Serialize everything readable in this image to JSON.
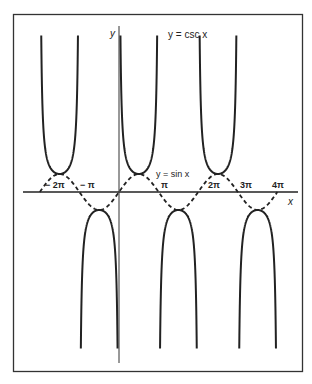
{
  "chart_data": {
    "type": "line",
    "title": "",
    "xlabel": "x",
    "ylabel": "y",
    "grid": false,
    "legend": "none",
    "xlim": [
      -2.05,
      4.45
    ],
    "xlim_units": "pi",
    "ylim": [
      -9,
      9
    ],
    "x_ticks": [
      {
        "value": -2,
        "label": "− 2π"
      },
      {
        "value": -1,
        "label": "− π"
      },
      {
        "value": 1,
        "label": "π"
      },
      {
        "value": 2,
        "label": "2π"
      },
      {
        "value": 3,
        "label": "3π"
      },
      {
        "value": 4,
        "label": "4π"
      }
    ],
    "series": [
      {
        "name": "y = csc x",
        "function": "csc",
        "style": "solid",
        "color": "#222222",
        "x_range_pi": [
          -2,
          4
        ]
      },
      {
        "name": "y = sin x",
        "function": "sin",
        "style": "dashed",
        "color": "#222222",
        "x_range_pi": [
          -2,
          4
        ]
      }
    ],
    "annotations": [
      {
        "text": "y = csc x",
        "near": "top center-right"
      },
      {
        "text": "y = sin x",
        "near": "first positive peak"
      }
    ]
  },
  "labels": {
    "y_axis": "y",
    "x_axis": "x",
    "csc_label": "y = csc x",
    "sin_label": "y = sin x",
    "ticks": [
      "− 2π",
      "− π",
      "π",
      "2π",
      "3π",
      "4π"
    ]
  }
}
